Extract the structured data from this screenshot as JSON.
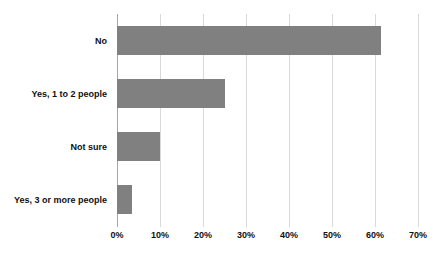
{
  "chart_data": {
    "type": "bar",
    "orientation": "horizontal",
    "title": "",
    "subtitle": "",
    "xlabel": "",
    "ylabel": "",
    "categories": [
      "No",
      "Yes, 1 to 2 people",
      "Not sure",
      "Yes, 3 or more people"
    ],
    "values": [
      61.5,
      25.0,
      10.0,
      3.5
    ],
    "value_labels": [
      "61.5%",
      "25.0%",
      "10.0%",
      "3.5%"
    ],
    "xlim": [
      0,
      70
    ],
    "ylim": null,
    "xtick_labels": [
      "0%",
      "10%",
      "20%",
      "30%",
      "40%",
      "50%",
      "60%",
      "70%"
    ],
    "xtick_values": [
      0,
      10,
      20,
      30,
      40,
      50,
      60,
      70
    ],
    "grid": "vertical",
    "legend": null,
    "legend_position": "none",
    "series": [
      {
        "name": "",
        "values": [
          61.5,
          25.0,
          10.0,
          3.5
        ],
        "color": "#808080"
      }
    ],
    "colors": {
      "bar": "#808080",
      "gridline": "#d9d9d9",
      "axis": "#a6a6a6",
      "text": "#111111",
      "background": "#ffffff"
    }
  }
}
